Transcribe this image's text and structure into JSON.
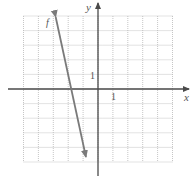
{
  "chart_data": {
    "type": "line",
    "title": "",
    "xlabel": "x",
    "ylabel": "y",
    "xlim": [
      -5,
      5
    ],
    "ylim": [
      -5,
      5
    ],
    "grid": true,
    "grid_step": 1,
    "tick_labels": {
      "x": "1",
      "y": "1"
    },
    "series": [
      {
        "name": "f",
        "equation": "f(x) = -5x - 9",
        "x": [
          -2.84,
          -0.81
        ],
        "y": [
          4.93,
          -4.66
        ],
        "x_intercept": -1.8,
        "arrows": "both"
      }
    ]
  },
  "colors": {
    "axis": "#4a4a4a",
    "grid": "#b8b8b8",
    "line": "#7a7a7a",
    "text": "#555555"
  }
}
